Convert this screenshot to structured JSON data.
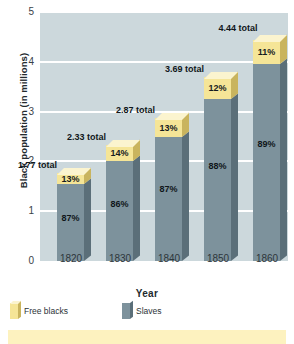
{
  "chart_data": {
    "type": "bar",
    "subtype": "stacked-3d-column",
    "title": "",
    "xlabel": "Year",
    "ylabel": "Black population (in millions)",
    "categories": [
      "1820",
      "1830",
      "1840",
      "1850",
      "1860"
    ],
    "ylim": [
      0,
      5
    ],
    "yticks": [
      "0",
      "1",
      "2",
      "3",
      "4",
      "5"
    ],
    "grid": true,
    "legend_position": "bottom-left",
    "totals": [
      "1.77 total",
      "2.33 total",
      "2.87 total",
      "3.69 total",
      "4.44 total"
    ],
    "total_values": [
      1.77,
      2.33,
      2.87,
      3.69,
      4.44
    ],
    "series": [
      {
        "name": "Slaves",
        "color": "#7d929c",
        "values": [
          1.54,
          2.01,
          2.49,
          3.25,
          3.95
        ],
        "labels": [
          "87%",
          "86%",
          "87%",
          "88%",
          "89%"
        ],
        "percents": [
          87,
          86,
          87,
          88,
          89
        ]
      },
      {
        "name": "Free blacks",
        "color": "#f5e597",
        "values": [
          0.23,
          0.32,
          0.38,
          0.44,
          0.49
        ],
        "labels": [
          "13%",
          "14%",
          "13%",
          "12%",
          "11%"
        ],
        "percents": [
          13,
          14,
          13,
          12,
          11
        ]
      }
    ],
    "colors": {
      "plot_background": "#ccd8dc",
      "gridline": "#ffffff",
      "slaves": "#7d929c",
      "slaves_side": "#5b6f79",
      "free_blacks": "#f5e597",
      "free_blacks_side": "#c9b45e",
      "free_blacks_top": "#fbf4cf",
      "text": "#10161a",
      "band": "#fdf2bf"
    }
  },
  "legend": {
    "items": [
      {
        "label": "Free blacks",
        "key": "free-blacks"
      },
      {
        "label": "Slaves",
        "key": "slaves"
      }
    ]
  }
}
